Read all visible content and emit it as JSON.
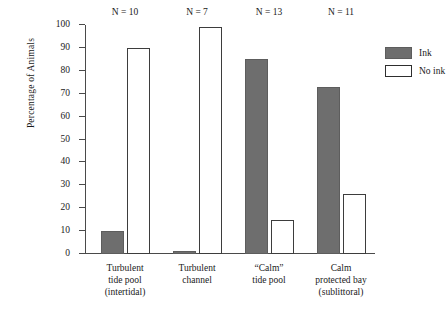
{
  "chart_data": {
    "type": "bar",
    "title": "",
    "xlabel": "",
    "ylabel": "Percentage of Animals",
    "ylim": [
      0,
      100
    ],
    "ytick_labels": [
      "0",
      "10",
      "20",
      "30",
      "40",
      "50",
      "60",
      "70",
      "80",
      "90",
      "100"
    ],
    "yticks": [
      0,
      10,
      20,
      30,
      40,
      50,
      60,
      70,
      80,
      90,
      100
    ],
    "grid": false,
    "legend_position": "right",
    "categories": [
      "Turbulent\ntide pool\n(intertidal)",
      "Turbulent\nchannel",
      "“Calm”\ntide pool",
      "Calm\nprotected bay\n(sublittoral)"
    ],
    "category_lines": [
      [
        "Turbulent",
        "tide pool",
        "(intertidal)"
      ],
      [
        "Turbulent",
        "channel"
      ],
      [
        "“Calm”",
        "tide pool"
      ],
      [
        "Calm",
        "protected bay",
        "(sublittoral)"
      ]
    ],
    "annotations": [
      "N = 10",
      "N = 7",
      "N = 13",
      "N = 11"
    ],
    "series": [
      {
        "name": "Ink",
        "values": [
          10,
          1.5,
          85,
          73
        ]
      },
      {
        "name": "No ink",
        "values": [
          90,
          99,
          15,
          26
        ]
      }
    ],
    "colors": {
      "ink": "#6e6e6e",
      "no_ink": "#ffffff",
      "outline": "#3d3d3d",
      "axis": "#4a4a4a",
      "text": "#1a1a1a"
    }
  },
  "legend": {
    "items": [
      {
        "label": "Ink",
        "swatch": "filled-gray-swatch"
      },
      {
        "label": "No ink",
        "swatch": "outlined-white-swatch"
      }
    ]
  }
}
